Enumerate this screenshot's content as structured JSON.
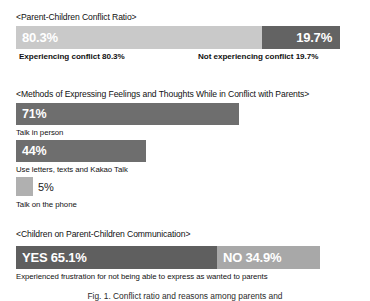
{
  "figure": {
    "caption": "Fig. 1. Conflict ratio and reasons among parents and",
    "sections": [
      {
        "header": "<Parent-Children Conflict Ratio>",
        "captions": {
          "left": "Experiencing conflict 80.3%",
          "right": "Not experiencing conflict 19.7%"
        },
        "segments": [
          {
            "label": "80.3%",
            "color": "#c9c9c9"
          },
          {
            "label": "19.7%",
            "color": "#636363"
          }
        ]
      },
      {
        "header": "<Methods of Expressing Feelings and Thoughts While in Conflict with Parents>",
        "items": [
          {
            "value_label": "71%",
            "caption": "Talk in person",
            "color": "#6e6e6e"
          },
          {
            "value_label": "44%",
            "caption": "Use letters, texts and Kakao Talk",
            "color": "#6e6e6e"
          },
          {
            "value_label": "5%",
            "caption": "Talk on the phone",
            "color": "#b0b0b0"
          }
        ]
      },
      {
        "header": "<Children on Parent-Children Communication>",
        "caption": "Experienced frustration for not being able to express as wanted to parents",
        "segments": [
          {
            "label": "YES 65.1%",
            "color": "#5f5f5f"
          },
          {
            "label": "NO 34.9%",
            "color": "#a8a8a8"
          }
        ]
      }
    ]
  },
  "chart_data": [
    {
      "type": "bar",
      "title": "<Parent-Children Conflict Ratio>",
      "orientation": "horizontal-stacked",
      "categories": [
        "Experiencing conflict",
        "Not experiencing conflict"
      ],
      "values": [
        80.3,
        19.7
      ],
      "value_labels": [
        "80.3%",
        "19.7%"
      ],
      "unit": "%",
      "xlabel": "",
      "ylabel": "",
      "xlim": [
        0,
        100
      ],
      "grid": false,
      "legend": "none",
      "colors": [
        "#c9c9c9",
        "#636363"
      ],
      "annotations": [
        "Experiencing conflict 80.3%",
        "Not experiencing conflict 19.7%"
      ]
    },
    {
      "type": "bar",
      "title": "<Methods of Expressing Feelings and Thoughts While in Conflict with Parents>",
      "orientation": "horizontal",
      "categories": [
        "Talk in person",
        "Use letters, texts and Kakao Talk",
        "Talk on the phone"
      ],
      "values": [
        71,
        44,
        5
      ],
      "value_labels": [
        "71%",
        "44%",
        "5%"
      ],
      "unit": "%",
      "xlabel": "",
      "ylabel": "",
      "xlim": [
        0,
        100
      ],
      "grid": false,
      "legend": "none",
      "colors": [
        "#6e6e6e",
        "#6e6e6e",
        "#b0b0b0"
      ]
    },
    {
      "type": "bar",
      "title": "<Children on Parent-Children Communication>",
      "orientation": "horizontal-stacked",
      "categories": [
        "YES",
        "NO"
      ],
      "values": [
        65.1,
        34.9
      ],
      "value_labels": [
        "YES 65.1%",
        "NO 34.9%"
      ],
      "unit": "%",
      "xlabel": "",
      "ylabel": "",
      "xlim": [
        0,
        100
      ],
      "grid": false,
      "legend": "none",
      "colors": [
        "#5f5f5f",
        "#a8a8a8"
      ],
      "annotations": [
        "Experienced frustration for not being able to express as wanted to parents"
      ]
    }
  ]
}
